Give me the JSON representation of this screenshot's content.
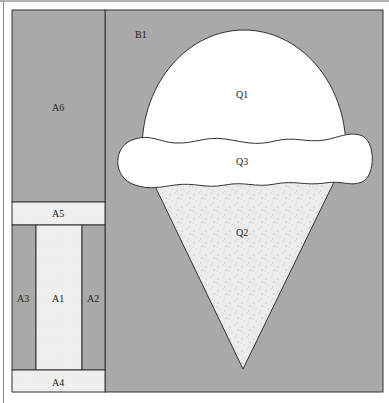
{
  "diagram": {
    "type": "quilt-block-pattern",
    "colors": {
      "background_gray": "#a9a9a9",
      "light_fabric": "#ececec",
      "white_fabric": "#ffffff",
      "outline": "#333333"
    },
    "labels": {
      "A1": "A1",
      "A2": "A2",
      "A3": "A3",
      "A4": "A4",
      "A5": "A5",
      "A6": "A6",
      "B1": "B1",
      "Q1": "Q1",
      "Q2": "Q2",
      "Q3": "Q3"
    },
    "pieces": [
      {
        "id": "A6",
        "fill": "gray",
        "region": "left column top"
      },
      {
        "id": "A5",
        "fill": "light",
        "region": "left column horizontal strip"
      },
      {
        "id": "A3",
        "fill": "gray",
        "region": "left column lower-left strip"
      },
      {
        "id": "A1",
        "fill": "light",
        "region": "left column lower-center strip"
      },
      {
        "id": "A2",
        "fill": "gray",
        "region": "left column lower-right strip"
      },
      {
        "id": "A4",
        "fill": "light",
        "region": "left column bottom strip"
      },
      {
        "id": "B1",
        "fill": "gray",
        "region": "right background"
      },
      {
        "id": "Q1",
        "fill": "white",
        "region": "ice cream scoop dome"
      },
      {
        "id": "Q3",
        "fill": "white",
        "region": "wavy scoop rim"
      },
      {
        "id": "Q2",
        "fill": "speckled light",
        "region": "cone"
      }
    ]
  }
}
